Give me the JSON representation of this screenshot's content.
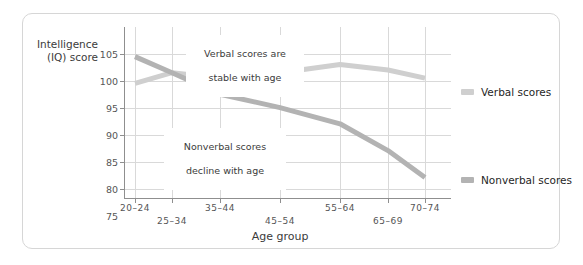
{
  "chart_data": {
    "type": "line",
    "title": "",
    "xlabel": "Age group",
    "ylabel": "Intelligence (IQ) score",
    "ylabel_line1": "Intelligence",
    "ylabel_line2": "(IQ) score",
    "categories": [
      "20–24",
      "25–34",
      "35–44",
      "45–54",
      "55–64",
      "65–69",
      "70–74"
    ],
    "ylim": [
      75,
      107
    ],
    "yticks": [
      105,
      100,
      95,
      90,
      85,
      80,
      75
    ],
    "grid": true,
    "legend_position": "right",
    "series": [
      {
        "name": "Verbal scores",
        "color": "#cfcfcf",
        "values": [
          96.5,
          98.5,
          97.5,
          98.5,
          100.0,
          99.0,
          97.5
        ]
      },
      {
        "name": "Nonverbal scores",
        "color": "#b3b3b3",
        "values": [
          101.5,
          98.5,
          94.5,
          92.0,
          89.0,
          84.0,
          79.0
        ]
      }
    ],
    "annotations": [
      {
        "id": "verbal-annotation",
        "text": "Verbal scores are\nstable with age",
        "line1": "Verbal scores are",
        "line2": "stable with age"
      },
      {
        "id": "nonverbal-annotation",
        "text": "Nonverbal scores\ndecline with age",
        "line1": "Nonverbal scores",
        "line2": "decline with age"
      }
    ]
  },
  "legend": {
    "items": [
      {
        "label": "Verbal scores",
        "color": "#cfcfcf"
      },
      {
        "label": "Nonverbal scores",
        "color": "#b3b3b3"
      }
    ]
  }
}
